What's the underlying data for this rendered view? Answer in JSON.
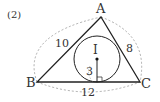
{
  "problem_number": "(2)",
  "vertices": {
    "A": "A",
    "B": "B",
    "C": "C"
  },
  "incenter": "I",
  "sides": {
    "AB": "10",
    "AC": "8",
    "BC": "12"
  },
  "inradius": "3"
}
